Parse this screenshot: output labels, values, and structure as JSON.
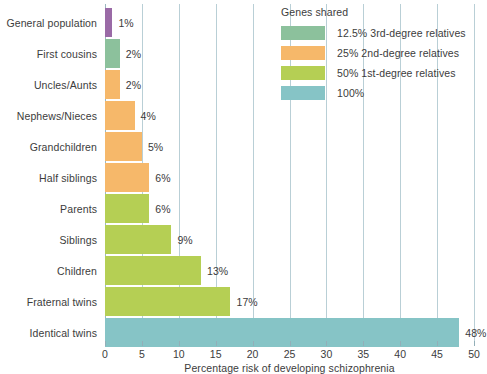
{
  "chart_data": {
    "type": "bar",
    "orientation": "horizontal",
    "title": "",
    "xlabel": "Percentage risk of developing schizophrenia",
    "ylabel": "",
    "xlim": [
      0,
      50
    ],
    "xticks": [
      "0",
      "5",
      "10",
      "15",
      "20",
      "25",
      "30",
      "35",
      "40",
      "45",
      "50"
    ],
    "grid": true,
    "legend_position": "top-right",
    "categories": [
      "General population",
      "First cousins",
      "Uncles/Aunts",
      "Nephews/Nieces",
      "Grandchildren",
      "Half siblings",
      "Parents",
      "Siblings",
      "Children",
      "Fraternal twins",
      "Identical twins"
    ],
    "values": [
      1,
      2,
      2,
      4,
      5,
      6,
      6,
      9,
      13,
      17,
      48
    ],
    "value_labels": [
      "1%",
      "2%",
      "2%",
      "4%",
      "5%",
      "6%",
      "6%",
      "9%",
      "13%",
      "17%",
      "48%"
    ],
    "bar_colors": [
      "#9a6aa6",
      "#8cc19c",
      "#f6b86a",
      "#f6b86a",
      "#f6b86a",
      "#f6b86a",
      "#b5cf54",
      "#b5cf54",
      "#b5cf54",
      "#b5cf54",
      "#86c4c6"
    ],
    "legend": {
      "title": "Genes shared",
      "entries": [
        {
          "label": "12.5% 3rd-degree relatives",
          "color": "#8cc19c"
        },
        {
          "label": "25% 2nd-degree relatives",
          "color": "#f6b86a"
        },
        {
          "label": "50% 1st-degree relatives",
          "color": "#b5cf54"
        },
        {
          "label": "100%",
          "color": "#86c4c6"
        }
      ]
    },
    "colors": {
      "gridline": "#b9cfd6",
      "axis": "#93afb8",
      "text": "#3c3c3c",
      "background": "#ffffff"
    }
  }
}
